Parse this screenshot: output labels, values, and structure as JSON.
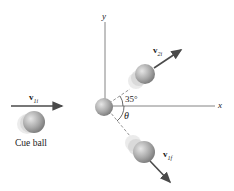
{
  "diagram": {
    "axes": {
      "x_label": "x",
      "y_label": "y"
    },
    "vectors": {
      "v1i": {
        "symbol": "v",
        "subscript": "1i"
      },
      "v2f": {
        "symbol": "v",
        "subscript": "2i"
      },
      "v1f": {
        "symbol": "v",
        "subscript": "1f"
      }
    },
    "angles": {
      "upper": "35°",
      "lower": "θ"
    },
    "cue_ball_label": "Cue ball",
    "colors": {
      "axis": "#555555",
      "arrow": "#4a4a4a",
      "ball": "#a8a8a8",
      "dash": "#777777"
    }
  }
}
